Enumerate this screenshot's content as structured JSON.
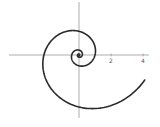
{
  "chart_data": {
    "type": "line",
    "title": "",
    "xlabel": "",
    "ylabel": "",
    "curve": {
      "form": "logarithmic_spiral",
      "a": 1,
      "b": 0.25,
      "theta_start": -14,
      "theta_end": 5.92
    },
    "x_ticks": [
      {
        "value": 2,
        "label": "2"
      },
      {
        "value": 4,
        "label": "4"
      }
    ],
    "xlim": [
      -4.9,
      5.0
    ],
    "ylim": [
      -4.5,
      3.4
    ],
    "grid": false,
    "legend": "none"
  }
}
